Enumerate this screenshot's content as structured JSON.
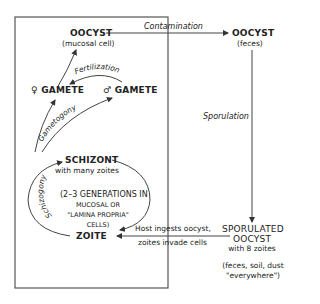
{
  "diagram": {
    "type": "life-cycle",
    "colors": {
      "line": "#444444",
      "text": "#222222",
      "background": "#ffffff"
    },
    "host_box_label": "",
    "nodes": {
      "oocyst_mucosal": {
        "title": "OOCYST",
        "sub": "(mucosal cell)"
      },
      "oocyst_feces": {
        "title": "OOCYST",
        "sub": "(feces)"
      },
      "female_gamete": {
        "symbol": "♀",
        "title": "GAMETE"
      },
      "male_gamete": {
        "symbol": "♂",
        "title": "GAMETE"
      },
      "schizont": {
        "title": "SCHIZONT",
        "sub": "with many zoites"
      },
      "generations_note": {
        "line1": "(2–3 GENERATIONS IN",
        "line2": "MUCOSAL OR",
        "line3": "\"LAMINA PROPRIA\"",
        "line4": "CELLS)"
      },
      "zoite": {
        "title": "ZOITE"
      },
      "sporulated_oocyst": {
        "line1": "SPORULATED",
        "line2": "OOCYST",
        "line3": "with 8 zoites"
      },
      "environment_note": {
        "line1": "(feces, soil, dust",
        "line2": "\"everywhere\")"
      }
    },
    "edges": {
      "contamination": "Contamination",
      "fertilization": "Fertilization",
      "gametogony": "Gametogony",
      "sporulation": "Sporulation",
      "schizogony": "Schizogony",
      "host_ingests_line1": "Host ingests oocyst,",
      "host_ingests_line2": "zoites invade cells"
    }
  }
}
